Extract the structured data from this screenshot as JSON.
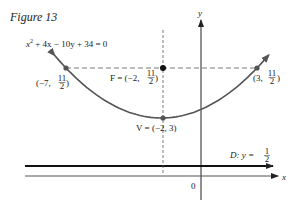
{
  "figure": {
    "title": "Figure 13",
    "equation": {
      "pre": "x",
      "exp": "2",
      "post": " + 4x − 10y + 34 = 0"
    },
    "axes": {
      "x_label": "x",
      "y_label": "y",
      "origin_label": "0"
    },
    "points": {
      "left": {
        "prefix": "(−7, ",
        "num": "11",
        "den": "2",
        "suffix": ")"
      },
      "right": {
        "prefix": "(3, ",
        "num": "11",
        "den": "2",
        "suffix": ")"
      },
      "focus": {
        "prefix": "F = (−2, ",
        "num": "11",
        "den": "2",
        "suffix": ")"
      },
      "vertex": {
        "text": "V = (−2, 3)"
      }
    },
    "directrix": {
      "prefix": "D: y = ",
      "num": "1",
      "den": "2"
    },
    "colors": {
      "curve": "#555555",
      "axis": "#222222",
      "point": "#111111",
      "dash": "#555555"
    }
  },
  "chart_data": {
    "type": "line",
    "title": "Figure 13",
    "equation": "x^2 + 4x - 10y + 34 = 0",
    "xlabel": "x",
    "ylabel": "y",
    "series": [
      {
        "name": "parabola",
        "function": "y = (x^2 + 4x + 34)/10",
        "x_range": [
          -7.6,
          3.6
        ]
      }
    ],
    "points": [
      {
        "name": "focus",
        "x": -2,
        "y": 5.5,
        "label": "F = (-2, 11/2)"
      },
      {
        "name": "vertex",
        "x": -2,
        "y": 3,
        "label": "V = (-2, 3)"
      },
      {
        "name": "latus-left",
        "x": -7,
        "y": 5.5,
        "label": "(-7, 11/2)"
      },
      {
        "name": "latus-right",
        "x": 3,
        "y": 5.5,
        "label": "(3, 11/2)"
      }
    ],
    "lines": [
      {
        "name": "directrix",
        "equation": "y = 1/2",
        "label": "D: y = 1/2"
      },
      {
        "name": "latus-rectum",
        "equation": "y = 11/2",
        "style": "dashed"
      },
      {
        "name": "axis-of-symmetry",
        "equation": "x = -2",
        "style": "dashed"
      }
    ],
    "grid": false
  }
}
